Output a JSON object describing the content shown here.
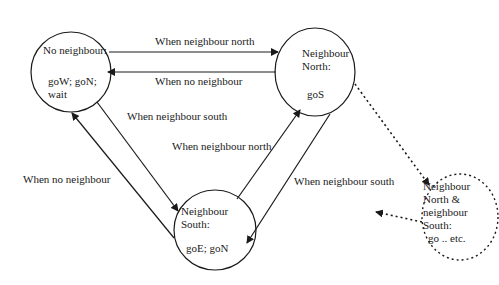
{
  "diagram": {
    "type": "state-machine",
    "colors": {
      "stroke": "#1a1a1a",
      "background": "#ffffff"
    },
    "states": [
      {
        "id": "none",
        "title": "No neighbour:",
        "actions_line1": "goW; goN;",
        "actions_line2": "wait"
      },
      {
        "id": "north",
        "title_line1": "Neighbour",
        "title_line2": "North:",
        "actions": "goS"
      },
      {
        "id": "south",
        "title_line1": "Neighbour",
        "title_line2": "South:",
        "actions": "goE; goN"
      },
      {
        "id": "both",
        "title_line1": "Neighbour",
        "title_line2": "North &",
        "title_line3": "neighbour",
        "title_line4": "South:",
        "actions": "go .. etc.",
        "style": "dashed"
      }
    ],
    "transitions": [
      {
        "from": "none",
        "to": "north",
        "label": "When neighbour north"
      },
      {
        "from": "north",
        "to": "none",
        "label": "When no neighbour"
      },
      {
        "from": "none",
        "to": "south",
        "label": "When neighbour south"
      },
      {
        "from": "south",
        "to": "none",
        "label": "When no neighbour"
      },
      {
        "from": "south",
        "to": "north",
        "label": "When neighbour north"
      },
      {
        "from": "north",
        "to": "south",
        "label": "When neighbour south"
      },
      {
        "from": "north",
        "to": "both",
        "label": "",
        "style": "dotted"
      },
      {
        "from": "both",
        "to": "elsewhere",
        "label": "",
        "style": "dotted"
      }
    ]
  }
}
